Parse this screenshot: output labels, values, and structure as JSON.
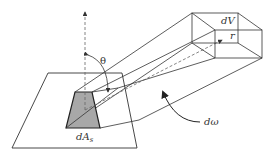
{
  "diagram": {
    "labels": {
      "theta": "θ",
      "dV": "dV",
      "r": "r",
      "dA_main": "dA",
      "dA_sub": "s",
      "domega": "dω"
    },
    "elements": [
      "base-plane",
      "surface-element-dAs",
      "surface-normal-arrow",
      "theta-angle-arc",
      "solid-angle-beam",
      "volume-element-dV",
      "direction-vector-r",
      "solid-angle-arrow-domega"
    ],
    "colors": {
      "line": "#333333",
      "surface_fill": "#a8a8a8",
      "background": "#ffffff"
    }
  }
}
